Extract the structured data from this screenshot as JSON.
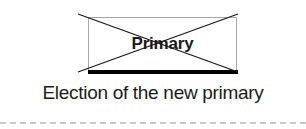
{
  "diagram": {
    "node": {
      "label": "Primary",
      "state": "crossed-out",
      "border_color": "#a8a8a8",
      "base_bar_color": "#000000",
      "strike_color": "#1a1a1a"
    },
    "caption": "Election of the new primary",
    "divider": {
      "style": "dashed",
      "color": "#c9c9c9"
    },
    "background_color": "#ffffff"
  }
}
